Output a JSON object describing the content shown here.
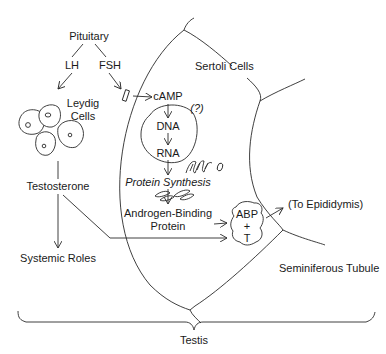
{
  "diagram": {
    "nodes": {
      "pituitary": "Pituitary",
      "lh": "LH",
      "fsh": "FSH",
      "leydig_line1": "Leydig",
      "leydig_line2": "Cells",
      "testosterone": "Testosterone",
      "systemic_roles": "Systemic Roles",
      "sertoli_cells": "Sertoli Cells",
      "camp": "cAMP",
      "question": "(?)",
      "dna": "DNA",
      "rna": "RNA",
      "protein_synthesis": "Protein Synthesis",
      "abp_line1": "Androgen-Binding",
      "abp_line2": "Protein",
      "abp_t_line1": "ABP",
      "abp_t_line2": "+",
      "abp_t_line3": "T",
      "to_epididymis": "(To Epididymis)",
      "seminiferous_tubule": "Seminiferous Tubule",
      "testis": "Testis"
    },
    "edges": [
      {
        "from": "Pituitary",
        "to": "LH"
      },
      {
        "from": "Pituitary",
        "to": "FSH"
      },
      {
        "from": "LH",
        "to": "Leydig Cells"
      },
      {
        "from": "FSH",
        "to": "Sertoli Cells receptor"
      },
      {
        "from": "receptor",
        "to": "cAMP"
      },
      {
        "from": "cAMP",
        "to": "DNA"
      },
      {
        "from": "DNA",
        "to": "RNA"
      },
      {
        "from": "RNA",
        "to": "Protein Synthesis"
      },
      {
        "from": "Protein Synthesis",
        "to": "Androgen-Binding Protein"
      },
      {
        "from": "Androgen-Binding Protein",
        "to": "ABP + T"
      },
      {
        "from": "Leydig Cells",
        "to": "Testosterone"
      },
      {
        "from": "Testosterone",
        "to": "Systemic Roles"
      },
      {
        "from": "Testosterone",
        "to": "ABP + T"
      },
      {
        "from": "ABP + T",
        "to": "(To Epididymis)"
      }
    ]
  }
}
